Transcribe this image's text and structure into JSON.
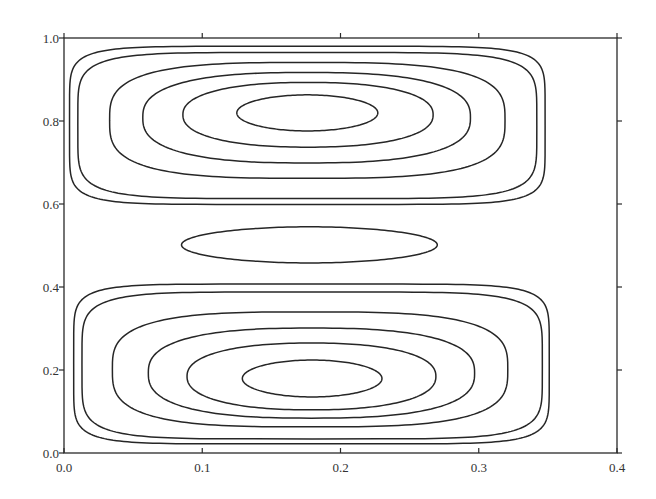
{
  "chart_data": {
    "type": "contour",
    "title": "",
    "xlabel": "",
    "ylabel": "",
    "xlim": [
      0.0,
      0.4
    ],
    "ylim": [
      0.0,
      1.0
    ],
    "grid": false,
    "legend": null,
    "x_ticks": [
      "0.0",
      "0.1",
      "0.2",
      "0.3",
      "0.4"
    ],
    "y_ticks": [
      "0.0",
      "0.2",
      "0.4",
      "0.6",
      "0.8",
      "1.0"
    ],
    "x_tick_values": [
      0.0,
      0.1,
      0.2,
      0.3,
      0.4
    ],
    "y_tick_values": [
      0.0,
      0.2,
      0.4,
      0.6,
      0.8,
      1.0
    ],
    "contour_color": "#262626",
    "cells": [
      {
        "name": "upper-cell",
        "center": [
          0.18,
          0.82
        ],
        "contours": [
          {
            "level": 1,
            "x": [
              0.004,
              0.348
            ],
            "y": [
              0.599,
              0.98
            ],
            "squareness": 7.0
          },
          {
            "level": 2,
            "x": [
              0.01,
              0.342
            ],
            "y": [
              0.613,
              0.965
            ],
            "squareness": 5.5
          },
          {
            "level": 3,
            "x": [
              0.033,
              0.319
            ],
            "y": [
              0.662,
              0.941
            ],
            "squareness": 3.2
          },
          {
            "level": 4,
            "x": [
              0.057,
              0.294
            ],
            "y": [
              0.699,
              0.917
            ],
            "squareness": 2.6
          },
          {
            "level": 5,
            "x": [
              0.086,
              0.267
            ],
            "y": [
              0.737,
              0.893
            ],
            "squareness": 2.3
          },
          {
            "level": 6,
            "x": [
              0.125,
              0.227
            ],
            "y": [
              0.776,
              0.863
            ],
            "squareness": 2.0
          }
        ]
      },
      {
        "name": "middle-cell",
        "center": [
          0.17,
          0.5
        ],
        "contours": [
          {
            "level": 1,
            "x": [
              0.085,
              0.27
            ],
            "y": [
              0.458,
              0.545
            ],
            "squareness": 2.0
          }
        ]
      },
      {
        "name": "lower-cell",
        "center": [
          0.18,
          0.19
        ],
        "contours": [
          {
            "level": 1,
            "x": [
              0.007,
              0.351
            ],
            "y": [
              0.022,
              0.407
            ],
            "squareness": 7.0
          },
          {
            "level": 2,
            "x": [
              0.013,
              0.346
            ],
            "y": [
              0.034,
              0.388
            ],
            "squareness": 5.5
          },
          {
            "level": 3,
            "x": [
              0.035,
              0.321
            ],
            "y": [
              0.063,
              0.34
            ],
            "squareness": 3.2
          },
          {
            "level": 4,
            "x": [
              0.061,
              0.297
            ],
            "y": [
              0.084,
              0.301
            ],
            "squareness": 2.6
          },
          {
            "level": 5,
            "x": [
              0.089,
              0.269
            ],
            "y": [
              0.104,
              0.265
            ],
            "squareness": 2.3
          },
          {
            "level": 6,
            "x": [
              0.129,
              0.23
            ],
            "y": [
              0.135,
              0.224
            ],
            "squareness": 2.0
          }
        ]
      }
    ]
  }
}
